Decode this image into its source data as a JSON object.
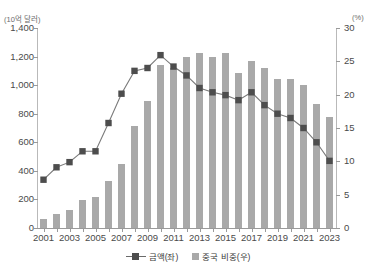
{
  "chart_data": {
    "type": "bar",
    "title": "",
    "subtitle": "",
    "xlabel": "",
    "ylabel": "(10억 달러)",
    "y2label": "(%)",
    "ylim": [
      0,
      1400
    ],
    "y2lim": [
      0,
      30
    ],
    "ytick_labels": [
      "1,400",
      "1,200",
      "1,000",
      "800",
      "600",
      "400",
      "200",
      "0"
    ],
    "ytick_values": [
      1400,
      1200,
      1000,
      800,
      600,
      400,
      200,
      0
    ],
    "y2tick_labels": [
      "30",
      "25",
      "20",
      "15",
      "10",
      "5",
      "0"
    ],
    "y2tick_values": [
      30,
      25,
      20,
      15,
      10,
      5,
      0
    ],
    "grid": false,
    "legend_position": "bottom",
    "x": [
      2001,
      2002,
      2003,
      2004,
      2005,
      2006,
      2007,
      2008,
      2009,
      2010,
      2011,
      2012,
      2013,
      2014,
      2015,
      2016,
      2017,
      2018,
      2019,
      2020,
      2021,
      2022,
      2023
    ],
    "categories": [
      "2001",
      "2002",
      "2003",
      "2004",
      "2005",
      "2006",
      "2007",
      "2008",
      "2009",
      "2010",
      "2011",
      "2012",
      "2013",
      "2014",
      "2015",
      "2016",
      "2017",
      "2018",
      "2019",
      "2020",
      "2021",
      "2022",
      "2023"
    ],
    "xtick_labels": [
      "2001",
      "2003",
      "2005",
      "2007",
      "2009",
      "2011",
      "2013",
      "2015",
      "2017",
      "2019",
      "2021",
      "2023"
    ],
    "series": [
      {
        "name": "중국 비중(우)",
        "type": "bar",
        "axis": "right",
        "unit": "%",
        "color": "#a9a9a9",
        "values": [
          1.3,
          2.1,
          2.7,
          4.2,
          4.6,
          7.0,
          9.6,
          15.3,
          19.0,
          24.5,
          24.0,
          25.7,
          26.3,
          25.6,
          26.3,
          23.2,
          25.1,
          24.0,
          22.4,
          22.4,
          21.5,
          18.6,
          16.6
        ]
      },
      {
        "name": "금액(좌)",
        "type": "line",
        "axis": "left",
        "unit": "10억 달러",
        "color": "#4d4d4d",
        "marker": "square",
        "values": [
          338,
          425,
          461,
          537,
          537,
          735,
          940,
          1100,
          1120,
          1210,
          1130,
          1068,
          980,
          950,
          930,
          895,
          950,
          860,
          800,
          770,
          700,
          600,
          470
        ]
      }
    ],
    "legend": [
      {
        "label": "금액(좌)",
        "marker": "line-square",
        "color": "#4d4d4d"
      },
      {
        "label": "중국 비중(우)",
        "marker": "square",
        "color": "#a9a9a9"
      }
    ]
  }
}
